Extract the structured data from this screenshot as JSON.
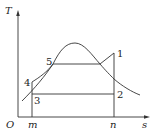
{
  "diagram": {
    "type": "T-s diagram",
    "axes": {
      "y_label": "T",
      "x_label": "s",
      "origin_label": "O",
      "x_ticks": [
        "m",
        "n"
      ]
    },
    "points": [
      {
        "id": "1",
        "label": "1"
      },
      {
        "id": "2",
        "label": "2"
      },
      {
        "id": "3",
        "label": "3"
      },
      {
        "id": "4",
        "label": "4"
      },
      {
        "id": "5",
        "label": "5"
      }
    ],
    "colors": {
      "line": "#333333",
      "text": "#222222",
      "background": "#ffffff"
    }
  }
}
